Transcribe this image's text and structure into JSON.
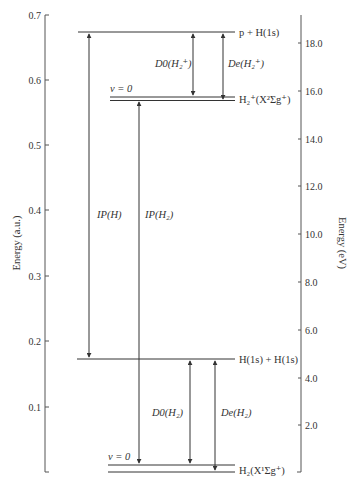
{
  "diagram": {
    "left_axis": {
      "title": "Energy (a.u.)",
      "ticks": [
        {
          "label": "0.7",
          "y": 15
        },
        {
          "label": "0.6",
          "y": 80
        },
        {
          "label": "0.5",
          "y": 145
        },
        {
          "label": "0.4",
          "y": 210
        },
        {
          "label": "0.3",
          "y": 276
        },
        {
          "label": "0.2",
          "y": 341
        },
        {
          "label": "0.1",
          "y": 407
        }
      ]
    },
    "right_axis": {
      "title": "Energy (eV)",
      "ticks": [
        {
          "label": "18.0",
          "y": 43
        },
        {
          "label": "16.0",
          "y": 91
        },
        {
          "label": "14.0",
          "y": 139
        },
        {
          "label": "12.0",
          "y": 186
        },
        {
          "label": "10.0",
          "y": 234
        },
        {
          "label": "8.0",
          "y": 282
        },
        {
          "label": "6.0",
          "y": 330
        },
        {
          "label": "4.0",
          "y": 378
        },
        {
          "label": "2.0",
          "y": 425
        }
      ]
    },
    "levels": {
      "p_H1s": "p + H(1s)",
      "H2plus": "H₂⁺(X²Σg⁺)",
      "H1s_H1s": "H(1s) + H(1s)",
      "H2": "H₂(X¹Σg⁺)",
      "v0_upper": "v = 0",
      "v0_lower": "v = 0"
    },
    "arrows": {
      "IP_H": "IP(H)",
      "IP_H2": "IP(H₂)",
      "D0_H2plus": "D0(H₂⁺)",
      "De_H2plus": "De(H₂⁺)",
      "D0_H2": "D0(H₂)",
      "De_H2": "De(H₂)"
    }
  }
}
